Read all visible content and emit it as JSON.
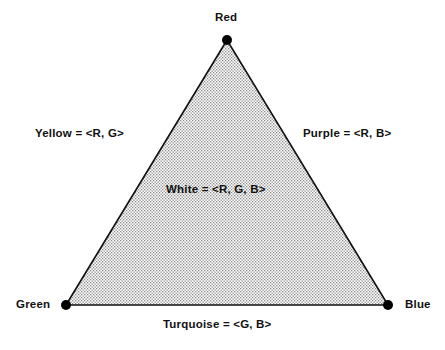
{
  "diagram": {
    "type": "color-triangle",
    "vertices": {
      "top": {
        "label": "Red"
      },
      "bottom_left": {
        "label": "Green"
      },
      "bottom_right": {
        "label": "Blue"
      }
    },
    "edges": {
      "left": {
        "label": "Yellow = <R, G>"
      },
      "right": {
        "label": "Purple = <R, B>"
      },
      "bottom": {
        "label": "Turquoise = <G, B>"
      }
    },
    "center": {
      "label": "White = <R, G, B>"
    },
    "colors": {
      "stroke": "#111111",
      "fill_pattern": "#b8b8b8",
      "background": "#ffffff"
    }
  }
}
